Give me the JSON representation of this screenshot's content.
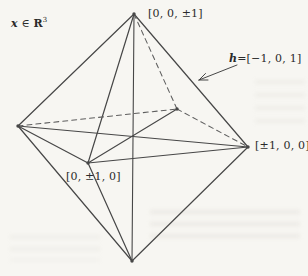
{
  "figure": {
    "annotation": {
      "variable": "x",
      "membership": "∈",
      "space": "R",
      "superscript": "3"
    },
    "vertex_labels": {
      "top": "[0, 0, ±1]",
      "right": "[±1, 0, 0]",
      "front": "[0, ±1, 0]"
    },
    "normal_label": {
      "variable": "h",
      "value": "=[−1, 0, 1]"
    },
    "colors": {
      "solid_line": "#474747",
      "dashed_line": "#5e5e5e",
      "text": "#2b2b2b",
      "background": "#f7f6f2"
    },
    "geometry": {
      "vertices": {
        "top": [
          134,
          14
        ],
        "bottom": [
          132,
          261
        ],
        "left": [
          18,
          126
        ],
        "right": [
          248,
          147
        ],
        "front": [
          88,
          163
        ],
        "back": [
          177,
          109
        ]
      },
      "solid_edges": [
        [
          "top",
          "left"
        ],
        [
          "top",
          "front"
        ],
        [
          "top",
          "right"
        ],
        [
          "left",
          "front"
        ],
        [
          "front",
          "right"
        ],
        [
          "bottom",
          "left"
        ],
        [
          "bottom",
          "front"
        ],
        [
          "bottom",
          "right"
        ]
      ],
      "dashed_edges": [
        [
          "top",
          "back"
        ],
        [
          "left",
          "back"
        ],
        [
          "back",
          "right"
        ]
      ],
      "axis_diagonals": [
        [
          "top",
          "bottom"
        ],
        [
          "left",
          "right"
        ],
        [
          "front",
          "back"
        ]
      ],
      "vertex_dots": [
        "top",
        "bottom",
        "left",
        "right",
        "front",
        "back"
      ],
      "arrow": {
        "tail": [
          237,
          65
        ],
        "tip": [
          199,
          80
        ],
        "head": [
          [
            208,
            80
          ],
          [
            205.5,
            73.5
          ]
        ]
      }
    }
  }
}
